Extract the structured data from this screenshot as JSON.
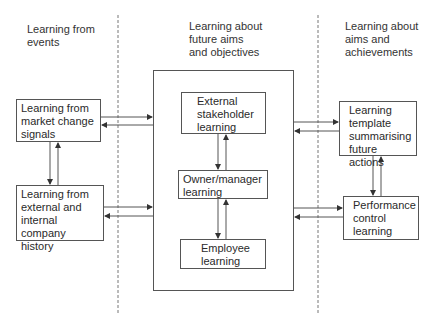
{
  "diagram": {
    "columns": [
      {
        "id": "events",
        "heading": [
          "Learning from",
          "events"
        ]
      },
      {
        "id": "future",
        "heading": [
          "Learning about",
          "future aims",
          "and objectives"
        ]
      },
      {
        "id": "aims",
        "heading": [
          "Learning about",
          "aims and",
          "achievements"
        ]
      }
    ],
    "boxes": {
      "market_change": [
        "Learning from",
        "market change",
        "signals"
      ],
      "company_history": [
        "Learning from",
        "external and",
        "internal company",
        "history"
      ],
      "external_stakeholder": [
        "External",
        "stakeholder",
        "learning"
      ],
      "owner_manager": [
        "Owner/manager",
        "learning"
      ],
      "employee": [
        "Employee",
        "learning"
      ],
      "learning_template": [
        "Learning",
        "template",
        "summarising",
        "future actions"
      ],
      "performance_control": [
        "Performance",
        "control",
        "learning"
      ]
    },
    "connections": [
      {
        "from": "market_change",
        "to": "central_box",
        "type": "bidirectional"
      },
      {
        "from": "company_history",
        "to": "central_box",
        "type": "bidirectional"
      },
      {
        "from": "market_change",
        "to": "company_history",
        "type": "bidirectional"
      },
      {
        "from": "external_stakeholder",
        "to": "owner_manager",
        "type": "bidirectional"
      },
      {
        "from": "owner_manager",
        "to": "employee",
        "type": "bidirectional"
      },
      {
        "from": "central_box",
        "to": "learning_template",
        "type": "bidirectional"
      },
      {
        "from": "central_box",
        "to": "performance_control",
        "type": "bidirectional"
      },
      {
        "from": "learning_template",
        "to": "performance_control",
        "type": "bidirectional"
      }
    ],
    "colors": {
      "line": "#555555",
      "dashed": "#777777",
      "text": "#2a2a2a"
    }
  }
}
